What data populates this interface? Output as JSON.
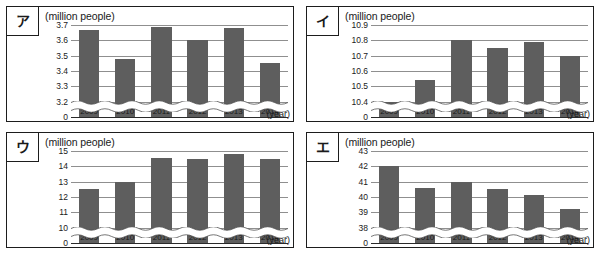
{
  "figure": {
    "top_partial_text": "",
    "caption": ""
  },
  "panels": [
    {
      "kana": "ア",
      "unit_label": "(million people)",
      "year_axis_label": "(year)",
      "chart_data": {
        "type": "bar",
        "title": "ア",
        "xlabel": "(year)",
        "ylabel": "(million people)",
        "categories": [
          "2009",
          "2010",
          "2011",
          "2012",
          "2013",
          "2014"
        ],
        "values": [
          3.67,
          3.48,
          3.69,
          3.6,
          3.68,
          3.45
        ],
        "yticks": [
          "3.7",
          "3.6",
          "3.5",
          "3.4",
          "3.3",
          "3.2",
          "0"
        ],
        "ytick_values": [
          3.7,
          3.6,
          3.5,
          3.4,
          3.3,
          3.2,
          0
        ],
        "ylim": [
          3.2,
          3.7
        ],
        "axis_break": true,
        "grid": true,
        "legend": "none"
      }
    },
    {
      "kana": "イ",
      "unit_label": "(million people)",
      "year_axis_label": "(year)",
      "chart_data": {
        "type": "bar",
        "title": "イ",
        "xlabel": "(year)",
        "ylabel": "(million people)",
        "categories": [
          "2009",
          "2010",
          "2011",
          "2012",
          "2013",
          "2014"
        ],
        "values": [
          10.4,
          10.54,
          10.8,
          10.75,
          10.79,
          10.7
        ],
        "yticks": [
          "10.9",
          "10.8",
          "10.7",
          "10.6",
          "10.5",
          "10.4",
          "0"
        ],
        "ytick_values": [
          10.9,
          10.8,
          10.7,
          10.6,
          10.5,
          10.4,
          0
        ],
        "ylim": [
          10.4,
          10.9
        ],
        "axis_break": true,
        "grid": true,
        "legend": "none"
      }
    },
    {
      "kana": "ウ",
      "unit_label": "(million people)",
      "year_axis_label": "(year)",
      "chart_data": {
        "type": "bar",
        "title": "ウ",
        "xlabel": "(year)",
        "ylabel": "(million people)",
        "categories": [
          "2009",
          "2010",
          "2011",
          "2012",
          "2013",
          "2014"
        ],
        "values": [
          12.55,
          12.95,
          14.55,
          14.45,
          14.8,
          14.45
        ],
        "yticks": [
          "15",
          "14",
          "13",
          "12",
          "11",
          "10",
          "0"
        ],
        "ytick_values": [
          15,
          14,
          13,
          12,
          11,
          10,
          0
        ],
        "ylim": [
          10,
          15
        ],
        "axis_break": true,
        "grid": true,
        "legend": "none"
      }
    },
    {
      "kana": "エ",
      "unit_label": "(million people)",
      "year_axis_label": "(year)",
      "chart_data": {
        "type": "bar",
        "title": "エ",
        "xlabel": "(year)",
        "ylabel": "(million people)",
        "categories": [
          "2009",
          "2010",
          "2011",
          "2012",
          "2013",
          "2014"
        ],
        "values": [
          42.0,
          40.6,
          40.95,
          40.5,
          40.1,
          39.2
        ],
        "yticks": [
          "43",
          "42",
          "41",
          "40",
          "39",
          "38",
          "0"
        ],
        "ytick_values": [
          43,
          42,
          41,
          40,
          39,
          38,
          0
        ],
        "ylim": [
          38,
          43
        ],
        "axis_break": true,
        "grid": true,
        "legend": "none"
      }
    }
  ],
  "style": {
    "bar_color": "#5e5e5e",
    "grid_color": "#8f8f8f",
    "frame_color": "#1d1d1d",
    "background": "#ffffff"
  }
}
